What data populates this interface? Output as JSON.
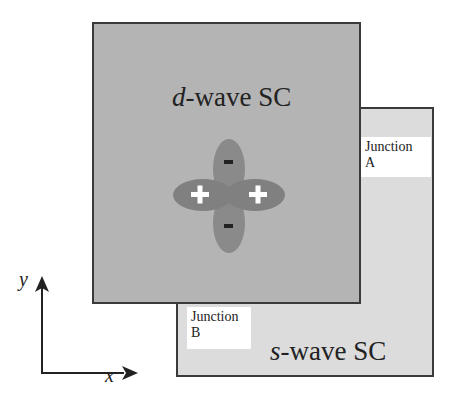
{
  "colors": {
    "d_wave_fill": "#b4b4b4",
    "s_wave_fill": "#dcdcdc",
    "lobe_fill": "#808080",
    "lobe_minus_fill": "#8a8a8a",
    "border": "#3a3a3a",
    "sign_plus": "#ffffff",
    "sign_minus": "#222222"
  },
  "d_wave": {
    "title_prefix": "d",
    "title_suffix": "-wave SC",
    "lobes": [
      {
        "direction": "left",
        "sign": "+"
      },
      {
        "direction": "right",
        "sign": "+"
      },
      {
        "direction": "up",
        "sign": "-"
      },
      {
        "direction": "down",
        "sign": "-"
      }
    ]
  },
  "s_wave": {
    "title_prefix": "s",
    "title_suffix": "-wave SC"
  },
  "junctions": {
    "a": {
      "line1": "Junction",
      "line2": "A"
    },
    "b": {
      "line1": "Junction",
      "line2": "B"
    }
  },
  "axes": {
    "x_label": "x",
    "y_label": "y"
  }
}
